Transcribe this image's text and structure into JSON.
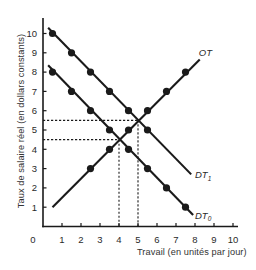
{
  "chart_data": {
    "type": "line",
    "title": "",
    "xlabel": "Travail (en unités par jour)",
    "ylabel": "Taux de salaire réel (en dollars constants)",
    "xlim": [
      0,
      10
    ],
    "ylim": [
      0,
      10
    ],
    "xticks": [
      1,
      2,
      3,
      4,
      5,
      6,
      7,
      8,
      9,
      10
    ],
    "yticks": [
      1,
      2,
      3,
      4,
      5,
      6,
      7,
      8,
      9,
      10
    ],
    "origin_label": "0",
    "grid": false,
    "legend": "inline curve labels",
    "series": [
      {
        "name": "OT",
        "label": "OT",
        "subscript": "",
        "line": [
          [
            0.5,
            1.0
          ],
          [
            8.25,
            8.65
          ]
        ],
        "points": [
          [
            2.5,
            3
          ],
          [
            3.5,
            4
          ],
          [
            4.5,
            5
          ],
          [
            5.5,
            6
          ],
          [
            6.5,
            7
          ],
          [
            7.5,
            8
          ]
        ],
        "label_pos": [
          8.2,
          8.85
        ]
      },
      {
        "name": "DT1",
        "label": "DT",
        "subscript": "1",
        "line": [
          [
            0.27,
            10.3
          ],
          [
            7.8,
            2.7
          ]
        ],
        "points": [
          [
            0.5,
            10
          ],
          [
            1.5,
            9
          ],
          [
            2.5,
            8
          ],
          [
            3.5,
            7
          ],
          [
            4.5,
            6
          ],
          [
            5.5,
            5
          ]
        ],
        "label_pos": [
          8.0,
          2.5
        ]
      },
      {
        "name": "DT0",
        "label": "DT",
        "subscript": "0",
        "line": [
          [
            0.27,
            8.35
          ],
          [
            7.9,
            0.6
          ]
        ],
        "points": [
          [
            0.5,
            8
          ],
          [
            1.5,
            7
          ],
          [
            2.5,
            6
          ],
          [
            3.5,
            5
          ],
          [
            4.5,
            4
          ],
          [
            5.5,
            3
          ],
          [
            6.5,
            2
          ],
          [
            7.5,
            1
          ]
        ],
        "label_pos": [
          8.0,
          0.4
        ]
      }
    ],
    "reference_lines": [
      {
        "name": "equilibrium-DT0",
        "x": 4,
        "y": 4.5
      },
      {
        "name": "equilibrium-DT1",
        "x": 5,
        "y": 5.5
      }
    ],
    "colors": {
      "ink": "#1a1a1a",
      "text": "#2a2a2a"
    }
  }
}
